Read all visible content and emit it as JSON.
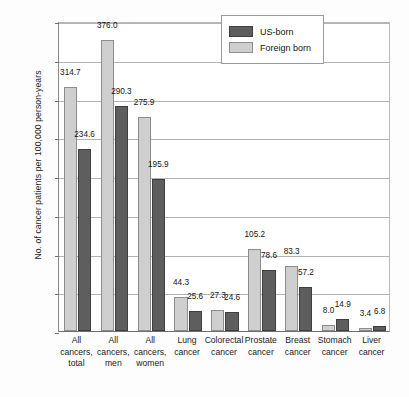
{
  "chart_data": {
    "type": "bar",
    "title": "",
    "subtitle": "",
    "xlabel": "",
    "ylabel": "No. of cancer patients per 100,000 person-years",
    "ylim": [
      0,
      400
    ],
    "yticks": [
      0,
      50,
      100,
      150,
      200,
      250,
      300,
      350,
      400
    ],
    "ytick_labels": [
      "0",
      "50",
      "100",
      "150",
      "200",
      "250",
      "300",
      "350",
      "400"
    ],
    "grid": true,
    "legend_position": "top-right-inside",
    "categories": [
      "All cancers, total",
      "All cancers, men",
      "All cancers, women",
      "Lung cancer",
      "Colorectal cancer",
      "Prostate cancer",
      "Breast cancer",
      "Stomach cancer",
      "Liver cancer"
    ],
    "category_lines": [
      [
        "All",
        "cancers,",
        "total"
      ],
      [
        "All",
        "cancers,",
        "men"
      ],
      [
        "All",
        "cancers,",
        "women"
      ],
      [
        "Lung",
        "cancer"
      ],
      [
        "Colorectal",
        "cancer"
      ],
      [
        "Prostate",
        "cancer"
      ],
      [
        "Breast",
        "cancer"
      ],
      [
        "Stomach",
        "cancer"
      ],
      [
        "Liver",
        "cancer"
      ]
    ],
    "series": [
      {
        "name": "Foreign born",
        "color": "#cfcfcf",
        "values": [
          314.7,
          376.0,
          275.9,
          44.3,
          27.3,
          105.2,
          83.3,
          8.0,
          3.4
        ],
        "value_labels": [
          "314.7",
          "376.0",
          "275.9",
          "44.3",
          "27.3",
          "105.2",
          "83.3",
          "8.0",
          "3.4"
        ]
      },
      {
        "name": "US-born",
        "color": "#5e5e5e",
        "values": [
          234.6,
          290.3,
          195.9,
          25.6,
          24.6,
          78.6,
          57.2,
          14.9,
          6.8
        ],
        "value_labels": [
          "234.6",
          "290.3",
          "195.9",
          "25.6",
          "24.6",
          "78.6",
          "57.2",
          "14.9",
          "6.8"
        ]
      }
    ]
  },
  "legend": {
    "entries": [
      {
        "label": "US-born",
        "swatch": "usborn"
      },
      {
        "label": "Foreign born",
        "swatch": "foreign"
      }
    ]
  }
}
